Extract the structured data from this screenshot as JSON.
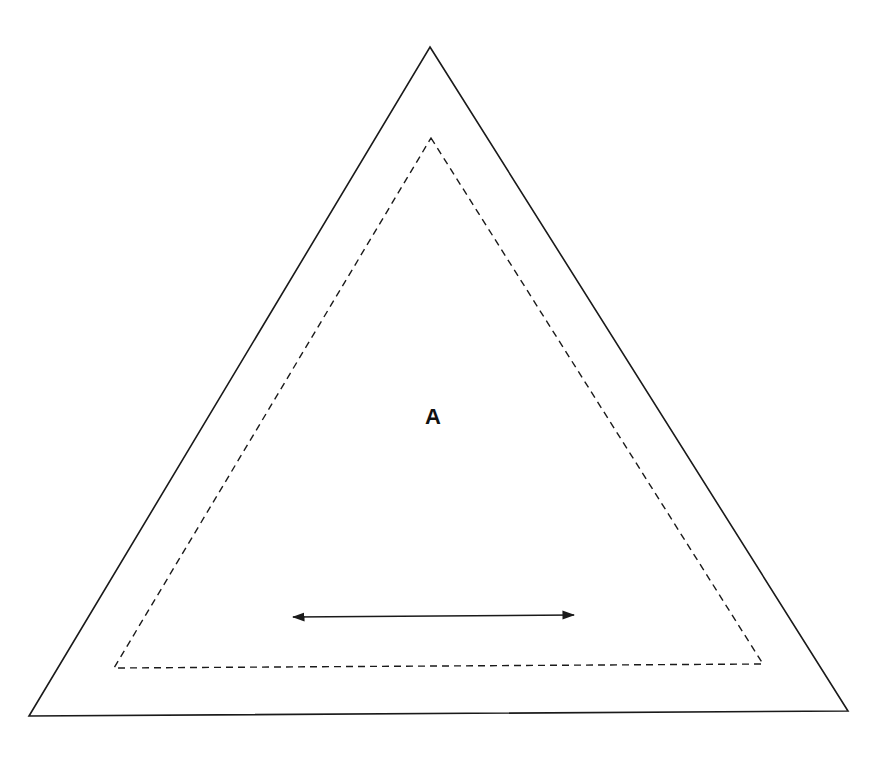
{
  "diagram": {
    "label": "A",
    "colors": {
      "stroke": "#1a1a1a",
      "background": "#ffffff"
    },
    "outer_triangle": {
      "style": "solid",
      "points": [
        [
          430,
          47
        ],
        [
          848,
          711
        ],
        [
          29,
          716
        ]
      ]
    },
    "inner_triangle": {
      "style": "dashed",
      "points": [
        [
          431,
          138
        ],
        [
          763,
          664
        ],
        [
          114,
          668
        ]
      ]
    },
    "arrow": {
      "type": "double-headed",
      "from": [
        285,
        617
      ],
      "to": [
        582,
        615
      ]
    },
    "label_position": [
      433,
      416
    ]
  }
}
